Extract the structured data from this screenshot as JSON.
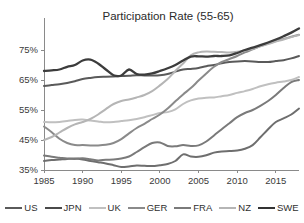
{
  "chart_data": {
    "type": "line",
    "title": "Participation Rate (55-65)",
    "xlabel": "",
    "ylabel": "",
    "xlim": [
      1985,
      2018
    ],
    "ylim": [
      35,
      83
    ],
    "grid": false,
    "legend_position": "bottom",
    "x_ticks": [
      "1985",
      "1990",
      "1995",
      "2000",
      "2005",
      "2010",
      "2015"
    ],
    "x_tick_values": [
      1985,
      1990,
      1995,
      2000,
      2005,
      2010,
      2015
    ],
    "y_ticks": [
      "35%",
      "45%",
      "55%",
      "65%",
      "75%"
    ],
    "y_tick_values": [
      35,
      45,
      55,
      65,
      75
    ],
    "x": [
      1985,
      1986,
      1987,
      1988,
      1989,
      1990,
      1991,
      1992,
      1993,
      1994,
      1995,
      1996,
      1997,
      1998,
      1999,
      2000,
      2001,
      2002,
      2003,
      2004,
      2005,
      2006,
      2007,
      2008,
      2009,
      2010,
      2011,
      2012,
      2013,
      2014,
      2015,
      2016,
      2017,
      2018
    ],
    "series": [
      {
        "name": "US",
        "color": "#5a5a5a",
        "width": 2.0,
        "values": [
          63.0,
          63.3,
          63.6,
          64.0,
          64.6,
          65.3,
          65.7,
          66.0,
          66.1,
          66.2,
          66.3,
          66.4,
          66.6,
          66.5,
          66.5,
          66.6,
          67.0,
          67.8,
          68.5,
          68.7,
          69.0,
          69.6,
          70.0,
          70.6,
          71.0,
          71.2,
          71.3,
          71.2,
          71.0,
          71.0,
          71.3,
          71.6,
          72.2,
          73.0
        ]
      },
      {
        "name": "JPN",
        "color": "#6e6e6e",
        "width": 2.0,
        "values": [
          38.0,
          38.3,
          38.5,
          38.7,
          38.8,
          38.5,
          38.0,
          37.6,
          37.2,
          36.6,
          36.0,
          36.2,
          36.5,
          36.4,
          36.3,
          36.6,
          37.0,
          38.0,
          40.2,
          39.5,
          39.4,
          39.9,
          40.8,
          41.2,
          41.3,
          41.5,
          42.1,
          43.3,
          45.9,
          48.6,
          51.0,
          52.2,
          53.5,
          55.5
        ]
      },
      {
        "name": "UK",
        "color": "#c0c0c0",
        "width": 2.0,
        "values": [
          51.0,
          50.9,
          51.0,
          51.3,
          51.7,
          51.8,
          51.5,
          51.2,
          50.9,
          51.0,
          51.3,
          51.6,
          52.0,
          52.6,
          53.3,
          54.0,
          54.3,
          55.2,
          57.0,
          58.2,
          58.8,
          59.1,
          59.2,
          59.6,
          60.0,
          60.7,
          61.3,
          62.0,
          62.9,
          63.6,
          64.1,
          64.5,
          65.0,
          66.0
        ]
      },
      {
        "name": "GER",
        "color": "#8a8a8a",
        "width": 2.0,
        "values": [
          49.5,
          47.6,
          45.4,
          44.0,
          43.3,
          43.3,
          43.2,
          43.2,
          43.4,
          44.0,
          45.3,
          47.2,
          49.0,
          50.4,
          52.0,
          53.5,
          55.5,
          57.9,
          60.2,
          62.3,
          64.8,
          67.2,
          69.4,
          71.0,
          72.0,
          73.0,
          74.2,
          75.2,
          76.3,
          77.2,
          78.0,
          78.7,
          79.4,
          80.1
        ]
      },
      {
        "name": "FRA",
        "color": "#7a7a7a",
        "width": 2.0,
        "values": [
          39.8,
          39.4,
          39.1,
          38.8,
          38.7,
          38.9,
          38.6,
          38.2,
          38.4,
          38.5,
          38.8,
          39.5,
          41.0,
          42.6,
          44.0,
          44.2,
          43.0,
          42.9,
          43.3,
          43.0,
          43.2,
          44.5,
          46.5,
          48.6,
          50.6,
          52.6,
          54.0,
          55.0,
          56.4,
          58.0,
          60.0,
          62.3,
          64.3,
          65.0
        ]
      },
      {
        "name": "NZ",
        "color": "#b5b5b5",
        "width": 2.0,
        "values": [
          45.0,
          46.0,
          47.5,
          49.0,
          50.2,
          51.0,
          52.0,
          53.5,
          55.3,
          57.0,
          58.0,
          58.5,
          59.2,
          60.0,
          61.3,
          63.2,
          65.3,
          68.0,
          70.5,
          73.2,
          74.2,
          74.5,
          74.4,
          74.3,
          74.2,
          74.4,
          74.8,
          75.4,
          76.2,
          77.0,
          77.8,
          78.5,
          79.3,
          80.0
        ]
      },
      {
        "name": "SWE",
        "color": "#3c3c3c",
        "width": 2.3,
        "values": [
          68.0,
          68.2,
          68.5,
          69.4,
          70.0,
          71.5,
          71.8,
          70.5,
          68.5,
          66.6,
          66.5,
          68.5,
          67.0,
          66.8,
          67.2,
          68.0,
          68.9,
          70.0,
          71.5,
          72.8,
          72.9,
          72.8,
          73.0,
          73.0,
          73.2,
          74.0,
          75.0,
          75.8,
          76.6,
          77.5,
          78.5,
          79.6,
          80.8,
          82.2
        ]
      }
    ]
  },
  "legend": {
    "items": [
      {
        "label": "US",
        "color": "#5a5a5a",
        "width": 2.0
      },
      {
        "label": "JPN",
        "color": "#4a4a4a",
        "width": 2.2
      },
      {
        "label": "UK",
        "color": "#c0c0c0",
        "width": 2.0
      },
      {
        "label": "GER",
        "color": "#8a8a8a",
        "width": 2.2
      },
      {
        "label": "FRA",
        "color": "#7a7a7a",
        "width": 2.0
      },
      {
        "label": "NZ",
        "color": "#b5b5b5",
        "width": 2.0
      },
      {
        "label": "SWE",
        "color": "#333333",
        "width": 2.4
      }
    ]
  }
}
